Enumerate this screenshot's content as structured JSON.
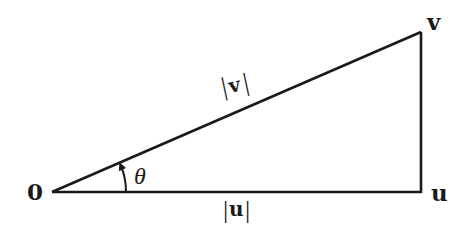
{
  "diagram": {
    "title": "",
    "type": "right-triangle-vector-projection",
    "vertices": {
      "origin": {
        "label": "0",
        "x": 52,
        "y": 192
      },
      "u": {
        "label": "u",
        "x": 421,
        "y": 192
      },
      "v": {
        "label": "v",
        "x": 421,
        "y": 32
      }
    },
    "edges": [
      {
        "from": "origin",
        "to": "v",
        "label": "|v|",
        "label_parts": [
          "|",
          "v",
          "|"
        ]
      },
      {
        "from": "origin",
        "to": "u",
        "label": "|u|",
        "label_parts": [
          "|",
          "u",
          "|"
        ]
      },
      {
        "from": "u",
        "to": "v",
        "label": ""
      }
    ],
    "angle": {
      "label": "θ",
      "at": "origin",
      "between": [
        "u",
        "v"
      ]
    },
    "colors": {
      "stroke": "#1a1a1a",
      "background": "#ffffff"
    }
  }
}
